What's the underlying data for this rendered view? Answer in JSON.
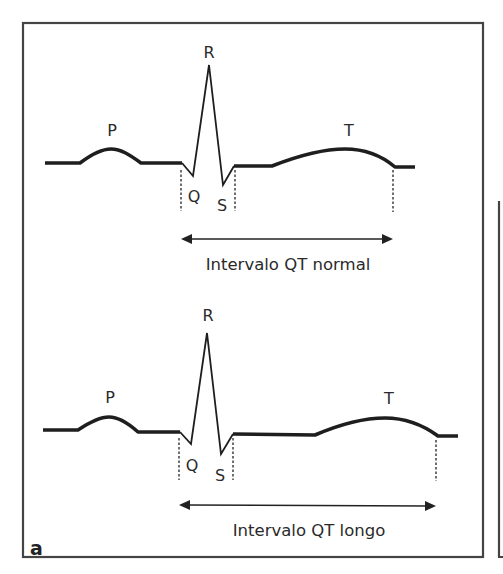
{
  "figure": {
    "panel_label": "a",
    "frame_color": "#444444",
    "stroke_color": "#1e1e1e"
  },
  "top_trace": {
    "title": "Normal QT interval",
    "waves": {
      "P": "P",
      "Q": "Q",
      "R": "R",
      "S": "S",
      "T": "T"
    },
    "interval_label": "Intervalo QT normal"
  },
  "bottom_trace": {
    "title": "Long QT interval",
    "waves": {
      "P": "P",
      "Q": "Q",
      "R": "R",
      "S": "S",
      "T": "T"
    },
    "interval_label": "Intervalo QT longo"
  }
}
